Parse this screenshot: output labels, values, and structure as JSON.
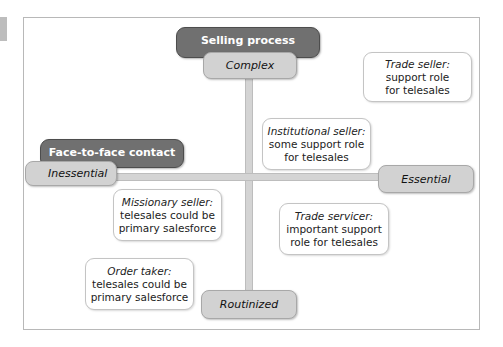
{
  "diagram": {
    "axes": {
      "vertical": {
        "label": "Selling process",
        "top": "Complex",
        "bottom": "Routinized"
      },
      "horizontal": {
        "label": "Face-to-face contact",
        "left": "Inessential",
        "right": "Essential"
      }
    },
    "quadrant_items": [
      {
        "title": "Trade seller:",
        "lines": [
          "support role",
          "for telesales"
        ]
      },
      {
        "title": "Institutional seller:",
        "lines": [
          "some support role",
          "for telesales"
        ]
      },
      {
        "title": "Missionary seller:",
        "lines": [
          "telesales could be",
          "primary salesforce"
        ]
      },
      {
        "title": "Trade servicer:",
        "lines": [
          "important support",
          "role for telesales"
        ]
      },
      {
        "title": "Order taker:",
        "lines": [
          "telesales could be",
          "primary salesforce"
        ]
      }
    ]
  },
  "colors": {
    "dark_label": "#707070",
    "light_label": "#d2d2d2",
    "axis": "#d4d4d4",
    "frame_border": "#b8b8b8"
  }
}
